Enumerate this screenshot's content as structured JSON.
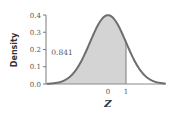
{
  "chart_data": {
    "type": "area",
    "title": "",
    "xlabel": "Z",
    "ylabel": "Density",
    "distribution": "standard normal",
    "x_ticks": [
      0,
      1
    ],
    "x_tick_labels": [
      "0",
      "1"
    ],
    "y_ticks": [
      0.0,
      0.1,
      0.2,
      0.3,
      0.4
    ],
    "y_tick_labels": [
      "0.0",
      "0.1",
      "0.2",
      "0.3",
      "0.4"
    ],
    "xlim": [
      -3.4,
      3.2
    ],
    "ylim": [
      0.0,
      0.4
    ],
    "grid": false,
    "shaded_region": {
      "from": -3.4,
      "to": 1,
      "area": 0.841
    },
    "annotations": [
      {
        "text": "0.841",
        "x": -1.7,
        "y": 0.2
      }
    ],
    "series": [
      {
        "name": "Standard normal density",
        "x": [
          -3,
          -2.5,
          -2,
          -1.5,
          -1,
          -0.5,
          0,
          0.5,
          1,
          1.5,
          2,
          2.5,
          3
        ],
        "values": [
          0.004,
          0.018,
          0.054,
          0.13,
          0.242,
          0.352,
          0.399,
          0.352,
          0.242,
          0.13,
          0.054,
          0.018,
          0.004
        ]
      }
    ]
  },
  "colors": {
    "curve": "#6e6e6e",
    "fill": "#d4d4d4",
    "axis": "#7a7a7a",
    "text": "#555555"
  }
}
